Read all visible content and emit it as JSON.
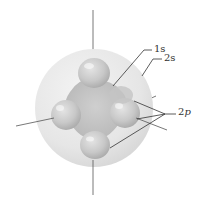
{
  "figure": {
    "labels": {
      "orbital_1s": "1s",
      "orbital_2s": "2s",
      "orbital_2p_num": "2",
      "orbital_2p_letter": "p"
    },
    "colors": {
      "sphere_2s": "#e6e6e6",
      "lobes_2p": "#c9c9c9",
      "axes": "#555555",
      "leader_lines": "#333333",
      "text": "#333333"
    }
  }
}
